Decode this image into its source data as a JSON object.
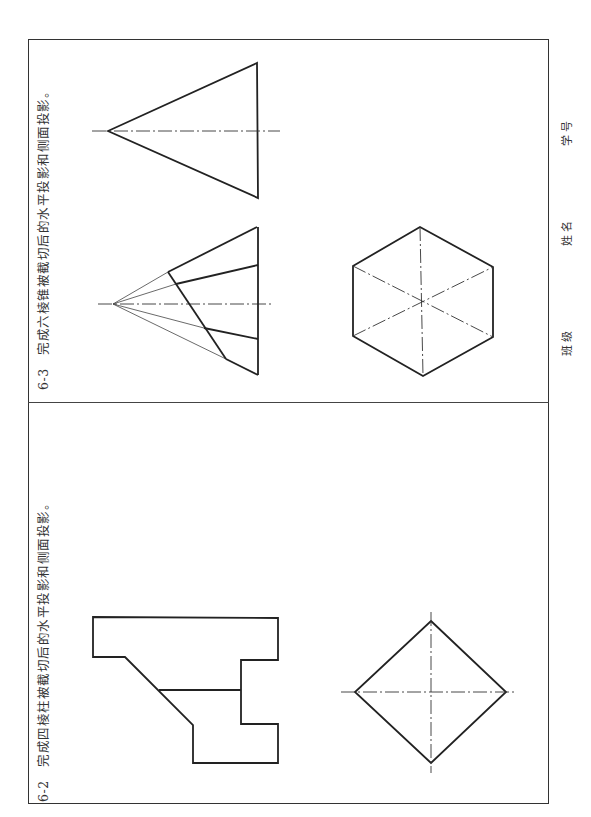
{
  "problems": [
    {
      "id": "6-3",
      "number": "6-3",
      "instruction": "完成六棱锥被截切后的水平投影和侧面投影。",
      "views": [
        "side-view-triangle",
        "front-view-cut-hexagonal-pyramid",
        "top-view-hexagon"
      ]
    },
    {
      "id": "6-2",
      "number": "6-2",
      "instruction": "完成四棱柱被截切后的水平投影和侧面投影。",
      "views": [
        "front-view-cut-prism",
        "top-view-square-diamond"
      ]
    }
  ],
  "student_fields": {
    "class_label": "班级",
    "name_label": "姓名",
    "id_label": "学号"
  }
}
